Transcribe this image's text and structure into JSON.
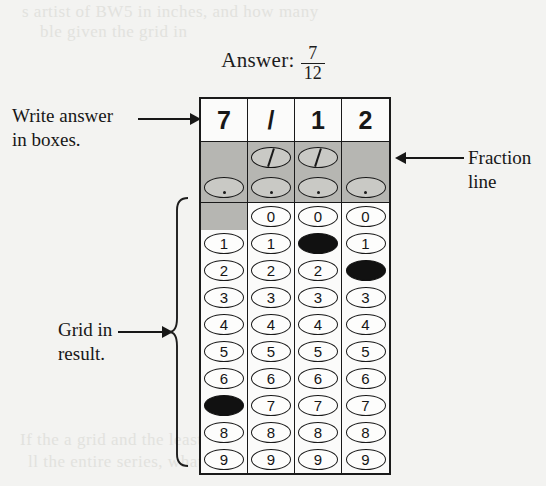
{
  "page": {
    "heading_label": "Answer:",
    "answer_numerator": "7",
    "answer_denominator": "12",
    "ghost_text": {
      "top_line_1": "s artist of BW5 in inches, and how many",
      "top_line_2": "ble given the grid in",
      "bottom_line_1": "If the a grid and the least value of a",
      "bottom_line_2": "ll the entire series, what is the value of the"
    }
  },
  "annotations": [
    {
      "id": "write-in-boxes",
      "text": "Write answer\nin boxes.",
      "arrow": "right"
    },
    {
      "id": "fraction-line",
      "text": "Fraction\nline",
      "arrow": "left"
    },
    {
      "id": "grid-in-result",
      "text": "Grid in\nresult.",
      "arrow": "right"
    }
  ],
  "grid": {
    "columns": 4,
    "write_in_row": [
      "7",
      "/",
      "1",
      "2"
    ],
    "fraction_row": [
      {
        "type": "none",
        "filled": false
      },
      {
        "type": "slash",
        "filled": true
      },
      {
        "type": "slash",
        "filled": false
      },
      {
        "type": "none",
        "filled": false
      }
    ],
    "decimal_row": [
      {
        "type": "dot",
        "filled": false
      },
      {
        "type": "dot",
        "filled": false
      },
      {
        "type": "dot",
        "filled": false
      },
      {
        "type": "dot",
        "filled": false
      }
    ],
    "digit_rows": [
      {
        "digit": "0",
        "cells": [
          {
            "blocked": true,
            "filled": false
          },
          {
            "blocked": false,
            "filled": false
          },
          {
            "blocked": false,
            "filled": false
          },
          {
            "blocked": false,
            "filled": false
          }
        ]
      },
      {
        "digit": "1",
        "cells": [
          {
            "blocked": false,
            "filled": false
          },
          {
            "blocked": false,
            "filled": false
          },
          {
            "blocked": false,
            "filled": true
          },
          {
            "blocked": false,
            "filled": false
          }
        ]
      },
      {
        "digit": "2",
        "cells": [
          {
            "blocked": false,
            "filled": false
          },
          {
            "blocked": false,
            "filled": false
          },
          {
            "blocked": false,
            "filled": false
          },
          {
            "blocked": false,
            "filled": true
          }
        ]
      },
      {
        "digit": "3",
        "cells": [
          {
            "blocked": false,
            "filled": false
          },
          {
            "blocked": false,
            "filled": false
          },
          {
            "blocked": false,
            "filled": false
          },
          {
            "blocked": false,
            "filled": false
          }
        ]
      },
      {
        "digit": "4",
        "cells": [
          {
            "blocked": false,
            "filled": false
          },
          {
            "blocked": false,
            "filled": false
          },
          {
            "blocked": false,
            "filled": false
          },
          {
            "blocked": false,
            "filled": false
          }
        ]
      },
      {
        "digit": "5",
        "cells": [
          {
            "blocked": false,
            "filled": false
          },
          {
            "blocked": false,
            "filled": false
          },
          {
            "blocked": false,
            "filled": false
          },
          {
            "blocked": false,
            "filled": false
          }
        ]
      },
      {
        "digit": "6",
        "cells": [
          {
            "blocked": false,
            "filled": false
          },
          {
            "blocked": false,
            "filled": false
          },
          {
            "blocked": false,
            "filled": false
          },
          {
            "blocked": false,
            "filled": false
          }
        ]
      },
      {
        "digit": "7",
        "cells": [
          {
            "blocked": false,
            "filled": true
          },
          {
            "blocked": false,
            "filled": false
          },
          {
            "blocked": false,
            "filled": false
          },
          {
            "blocked": false,
            "filled": false
          }
        ]
      },
      {
        "digit": "8",
        "cells": [
          {
            "blocked": false,
            "filled": false
          },
          {
            "blocked": false,
            "filled": false
          },
          {
            "blocked": false,
            "filled": false
          },
          {
            "blocked": false,
            "filled": false
          }
        ]
      },
      {
        "digit": "9",
        "cells": [
          {
            "blocked": false,
            "filled": false
          },
          {
            "blocked": false,
            "filled": false
          },
          {
            "blocked": false,
            "filled": false
          },
          {
            "blocked": false,
            "filled": false
          }
        ]
      }
    ]
  },
  "colors": {
    "ink": "#1a1a1a",
    "paper": "#f3f3f1",
    "shaded_band": "#b6b6b2",
    "filled_bubble": "#111111"
  }
}
